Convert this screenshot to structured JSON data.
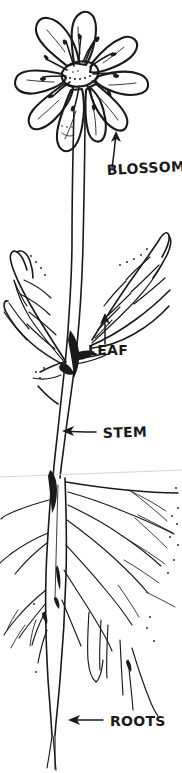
{
  "illustration": {
    "title": "Parts of a Flowering Plant",
    "subject": "flower-plant-anatomy",
    "style": "hand-drawn black ink line drawing on white",
    "background_color": "#ffffff",
    "ink_color": "#1a1a1a",
    "ground_line_color": "#cfcfcf",
    "canvas": {
      "width": 182,
      "height": 773
    }
  },
  "callouts": [
    {
      "id": "blossom",
      "label": "BLOSSOM",
      "text_x": 107,
      "text_y": 175,
      "font_size": 14,
      "rotation": -3,
      "arrow_direction": "up",
      "points_to": "flower-head"
    },
    {
      "id": "leaf",
      "label": "LEAF",
      "text_x": 88,
      "text_y": 355,
      "font_size": 14,
      "rotation": 0,
      "arrow_direction": "up",
      "points_to": "right-leaf"
    },
    {
      "id": "stem",
      "label": "STEM",
      "text_x": 103,
      "text_y": 440,
      "font_size": 14,
      "rotation": -2,
      "arrow_direction": "left",
      "points_to": "main-stem"
    },
    {
      "id": "roots",
      "label": "ROOTS",
      "text_x": 110,
      "text_y": 726,
      "font_size": 14,
      "rotation": 0,
      "arrow_direction": "left",
      "points_to": "taproot"
    }
  ],
  "plant_parts": {
    "blossom": {
      "name": "blossom",
      "petal_count": 9,
      "center": {
        "cx": 80,
        "cy": 72,
        "rx": 19,
        "ry": 13
      },
      "has_stamens": true,
      "stamen_count": 12
    },
    "leaves": {
      "name": "leaf",
      "count": 2,
      "sides": [
        "left",
        "right"
      ],
      "has_veins": true
    },
    "stem": {
      "name": "stem",
      "top_y": 110,
      "bottom_y": 478
    },
    "roots": {
      "name": "roots",
      "type": "taproot with fibrous branches",
      "ground_line_y": 474
    }
  }
}
